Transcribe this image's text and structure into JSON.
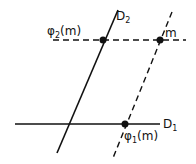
{
  "diagram": {
    "lines": {
      "d1": {
        "label": "D",
        "sub": "1",
        "style": "solid"
      },
      "d2": {
        "label": "D",
        "sub": "2",
        "style": "solid"
      },
      "horizontal_dashed": {
        "style": "dashed"
      },
      "parallel_dashed": {
        "style": "dashed"
      }
    },
    "points": {
      "m": {
        "label": "m"
      },
      "phi2": {
        "label_main": "φ",
        "sub": "2",
        "args": "(m)"
      },
      "phi1": {
        "label_main": "φ",
        "sub": "1",
        "args": "(m)"
      }
    },
    "colors": {
      "ink": "#111111",
      "background": "#ffffff"
    }
  }
}
